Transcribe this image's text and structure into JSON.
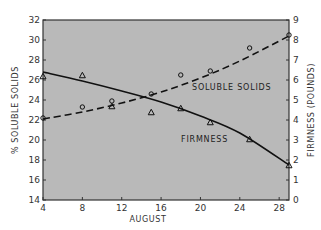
{
  "chart_data": {
    "type": "line",
    "title": "",
    "xlabel": "AUGUST",
    "ylabel": "% SOLUBLE SOLIDS",
    "ylabel_right": "FIRMNESS (POUNDS)",
    "xlim": [
      4,
      29
    ],
    "ylim": [
      14,
      32
    ],
    "ylim_right": [
      0,
      9
    ],
    "x_ticks": [
      4,
      8,
      12,
      16,
      20,
      24,
      28
    ],
    "y_ticks": [
      14,
      16,
      18,
      20,
      22,
      24,
      26,
      28,
      30,
      32
    ],
    "y_ticks_right": [
      0,
      1,
      2,
      3,
      4,
      5,
      6,
      7,
      8,
      9
    ],
    "grid": false,
    "background": "#b9b9b9",
    "series": [
      {
        "name": "SOLUBLE SOLIDS",
        "axis": "left",
        "marker": "circle",
        "line_style": "dashed",
        "x": [
          4,
          8,
          11,
          15,
          18,
          21,
          25,
          29
        ],
        "values": [
          22.2,
          23.3,
          23.9,
          24.6,
          26.5,
          26.9,
          29.2,
          30.5
        ],
        "fit_curve": [
          [
            4,
            22.1
          ],
          [
            8,
            22.8
          ],
          [
            12,
            23.7
          ],
          [
            16,
            24.8
          ],
          [
            20,
            26.2
          ],
          [
            24,
            27.9
          ],
          [
            29,
            30.4
          ]
        ]
      },
      {
        "name": "FIRMNESS",
        "axis": "right",
        "marker": "triangle",
        "line_style": "solid",
        "x": [
          4,
          8,
          11,
          15,
          18,
          21,
          25,
          29
        ],
        "values": [
          6.2,
          6.25,
          4.7,
          4.4,
          4.6,
          3.9,
          3.05,
          1.75
        ],
        "fit_curve": [
          [
            4,
            6.4
          ],
          [
            8,
            5.95
          ],
          [
            12,
            5.45
          ],
          [
            16,
            4.9
          ],
          [
            20,
            4.2
          ],
          [
            24,
            3.35
          ],
          [
            29,
            1.75
          ]
        ]
      }
    ],
    "annotations": [
      {
        "text": "SOLUBLE SOLIDS",
        "x": 19.5,
        "y_left": 25.2
      },
      {
        "text": "FIRMNESS",
        "x": 16.5,
        "y_right": 2.95
      }
    ]
  },
  "labels": {
    "xlabel": "AUGUST",
    "ylabel_left": "% SOLUBLE SOLIDS",
    "ylabel_right": "FIRMNESS (POUNDS)",
    "series_soluble": "SOLUBLE SOLIDS",
    "series_firmness": "FIRMNESS"
  }
}
